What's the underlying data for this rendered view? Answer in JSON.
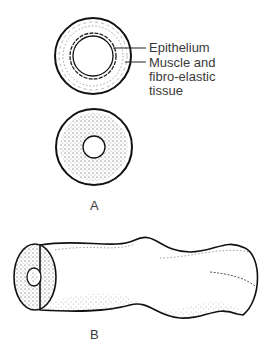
{
  "figure": {
    "panel_a": {
      "label": "A",
      "callouts": [
        {
          "text": "Epithelium"
        },
        {
          "text": "Muscle and fibro-elastic tissue",
          "lines": [
            "Muscle and",
            "fibro-elastic",
            "tissue"
          ]
        }
      ]
    },
    "panel_b": {
      "label": "B"
    }
  }
}
